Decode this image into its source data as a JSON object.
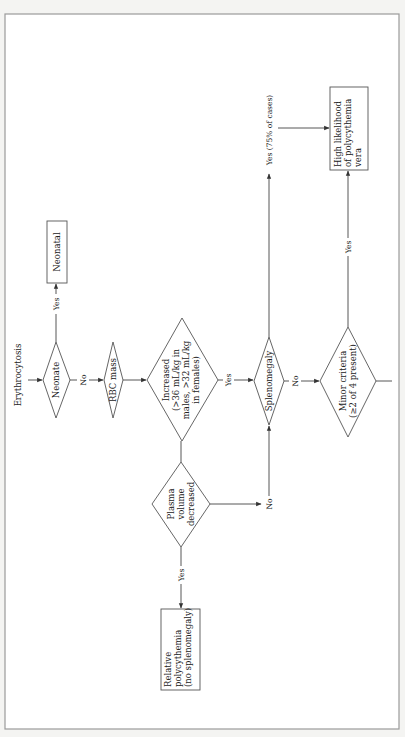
{
  "diagram": {
    "orientation": "rotated 90 degrees counter-clockwise",
    "start": {
      "label": "Erythrocytosis"
    },
    "nodes": {
      "neonate": {
        "type": "decision",
        "lines": [
          "Neonate"
        ]
      },
      "neonatal": {
        "type": "outcome",
        "lines": [
          "Neonatal"
        ]
      },
      "rbc_mass": {
        "type": "decision",
        "lines": [
          "RBC mass"
        ]
      },
      "increased": {
        "type": "decision",
        "lines": [
          "Increased",
          "(>36 mL/kg in",
          "males, >32 mL/kg",
          "in females)"
        ]
      },
      "plasma": {
        "type": "decision",
        "lines": [
          "Plasma",
          "volume",
          "decreased"
        ]
      },
      "relative": {
        "type": "outcome",
        "lines": [
          "Relative",
          "polycythemia",
          "(no splenomegaly)"
        ]
      },
      "splenomegaly": {
        "type": "decision",
        "lines": [
          "Splenomegaly"
        ]
      },
      "minor": {
        "type": "decision",
        "lines": [
          "Minor criteria",
          "(≥2 of 4 present)"
        ]
      },
      "high": {
        "type": "outcome",
        "lines": [
          "High likelihood",
          "of polycythemia",
          "vera"
        ]
      }
    },
    "edges": {
      "neonate_yes": "Yes",
      "neonate_no": "No",
      "increased_yes": "Yes",
      "plasma_yes": "Yes",
      "plasma_no": "No",
      "spleno_yes": "Yes (75% of cases)",
      "spleno_no": "No",
      "minor_yes": "Yes"
    }
  }
}
